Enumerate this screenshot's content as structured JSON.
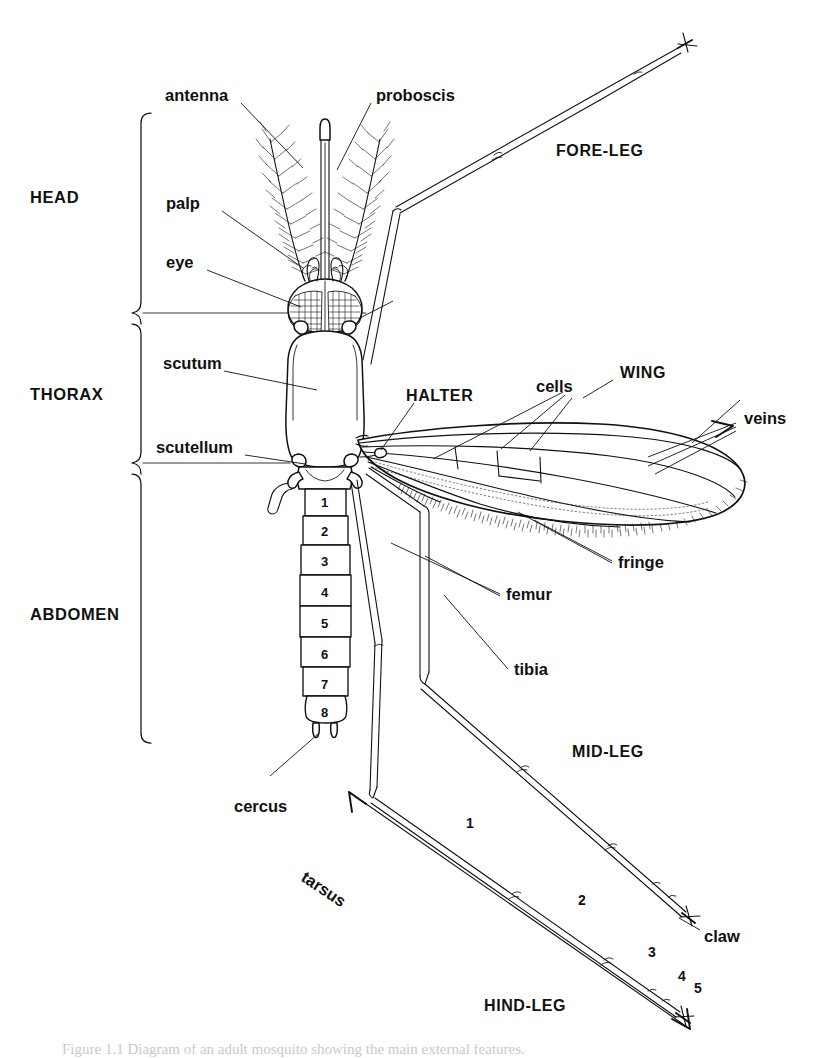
{
  "figure": {
    "background_color": "#ffffff",
    "ink_color": "#111111"
  },
  "region_labels": [
    {
      "name": "head",
      "text": "HEAD"
    },
    {
      "name": "thorax",
      "text": "THORAX"
    },
    {
      "name": "abdomen",
      "text": "ABDOMEN"
    }
  ],
  "part_labels": {
    "antenna": "antenna",
    "proboscis": "proboscis",
    "palp": "palp",
    "eye": "eye",
    "scutum": "scutum",
    "scutellum": "scutellum",
    "halter": "HALTER",
    "cells": "cells",
    "wing": "WING",
    "veins": "veins",
    "fringe": "fringe",
    "femur": "femur",
    "tibia": "tibia",
    "cercus": "cercus",
    "tarsus": "tarsus",
    "claw": "claw",
    "fore_leg": "FORE-LEG",
    "mid_leg": "MID-LEG",
    "hind_leg": "HIND-LEG"
  },
  "abdomen_segments": [
    "1",
    "2",
    "3",
    "4",
    "5",
    "6",
    "7",
    "8"
  ],
  "tarsus_segments": [
    "1",
    "2",
    "3",
    "4",
    "5"
  ],
  "caption": {
    "text": "Figure 1.1  Diagram of an adult mosquito showing the main external features."
  }
}
